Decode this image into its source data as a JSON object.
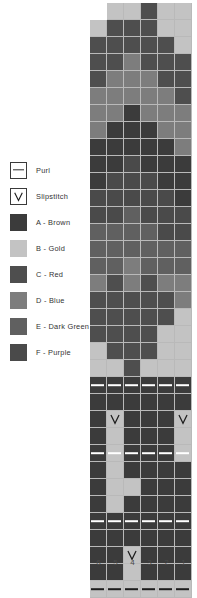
{
  "legend": {
    "title": "Chart Key",
    "items": [
      {
        "icon": "purl-dash-icon",
        "symbol": "purl",
        "label": "Purl",
        "color": "#ffffff"
      },
      {
        "icon": "slipstitch-v-icon",
        "symbol": "slip",
        "label": "Slipstitch",
        "color": "#ffffff"
      },
      {
        "icon": "color-swatch-icon",
        "symbol": "fill",
        "label": "A - Brown",
        "color": "#3b3b3b"
      },
      {
        "icon": "color-swatch-icon",
        "symbol": "fill",
        "label": "B - Gold",
        "color": "#c3c3c3"
      },
      {
        "icon": "color-swatch-icon",
        "symbol": "fill",
        "label": "C - Red",
        "color": "#4e4e4e"
      },
      {
        "icon": "color-swatch-icon",
        "symbol": "fill",
        "label": "D - Blue",
        "color": "#7d7d7d"
      },
      {
        "icon": "color-swatch-icon",
        "symbol": "fill",
        "label": "E - Dark Green",
        "color": "#606060"
      },
      {
        "icon": "color-swatch-icon",
        "symbol": "fill",
        "label": "F - Purple",
        "color": "#4a4a4a"
      }
    ]
  },
  "chart_data": {
    "type": "heatmap",
    "columns": 6,
    "rows": 34,
    "cell_size_px": 17,
    "grid_line_color": "#b9b9b9",
    "column_labels": [
      "6",
      "5",
      "4",
      "3",
      "2",
      "1"
    ],
    "palette": {
      "A": "#3b3b3b",
      "B": "#c3c3c3",
      "C": "#4e4e4e",
      "D": "#7d7d7d",
      "E": "#606060",
      "F": "#4a4a4a",
      "blank": "#ffffff"
    },
    "symbol_colors": {
      "purl_light": "#ffffff",
      "purl_dark": "#1d1d1d",
      "slip_stroke": "#1d1d1d"
    },
    "legend_position": "left",
    "grid": [
      {
        "row": 34,
        "cells": [
          {
            "key": "blank"
          },
          {
            "key": "B"
          },
          {
            "key": "B"
          },
          {
            "key": "C"
          },
          {
            "key": "B"
          },
          {
            "key": "B"
          }
        ]
      },
      {
        "row": 33,
        "cells": [
          {
            "key": "B"
          },
          {
            "key": "C"
          },
          {
            "key": "C"
          },
          {
            "key": "C"
          },
          {
            "key": "B"
          },
          {
            "key": "B"
          }
        ]
      },
      {
        "row": 32,
        "cells": [
          {
            "key": "C"
          },
          {
            "key": "C"
          },
          {
            "key": "C"
          },
          {
            "key": "C"
          },
          {
            "key": "C"
          },
          {
            "key": "B"
          }
        ]
      },
      {
        "row": 31,
        "cells": [
          {
            "key": "C"
          },
          {
            "key": "C"
          },
          {
            "key": "D"
          },
          {
            "key": "C"
          },
          {
            "key": "C"
          },
          {
            "key": "C"
          }
        ]
      },
      {
        "row": 30,
        "cells": [
          {
            "key": "C"
          },
          {
            "key": "D"
          },
          {
            "key": "D"
          },
          {
            "key": "D"
          },
          {
            "key": "C"
          },
          {
            "key": "C"
          }
        ]
      },
      {
        "row": 29,
        "cells": [
          {
            "key": "D"
          },
          {
            "key": "D"
          },
          {
            "key": "D"
          },
          {
            "key": "D"
          },
          {
            "key": "D"
          },
          {
            "key": "C"
          }
        ]
      },
      {
        "row": 28,
        "cells": [
          {
            "key": "D"
          },
          {
            "key": "D"
          },
          {
            "key": "A"
          },
          {
            "key": "D"
          },
          {
            "key": "D"
          },
          {
            "key": "D"
          }
        ]
      },
      {
        "row": 27,
        "cells": [
          {
            "key": "D"
          },
          {
            "key": "A"
          },
          {
            "key": "A"
          },
          {
            "key": "A"
          },
          {
            "key": "D"
          },
          {
            "key": "D"
          }
        ]
      },
      {
        "row": 26,
        "cells": [
          {
            "key": "A"
          },
          {
            "key": "A"
          },
          {
            "key": "A"
          },
          {
            "key": "A"
          },
          {
            "key": "A"
          },
          {
            "key": "D"
          }
        ]
      },
      {
        "row": 25,
        "cells": [
          {
            "key": "A"
          },
          {
            "key": "A"
          },
          {
            "key": "F"
          },
          {
            "key": "A"
          },
          {
            "key": "A"
          },
          {
            "key": "A"
          }
        ]
      },
      {
        "row": 24,
        "cells": [
          {
            "key": "A"
          },
          {
            "key": "F"
          },
          {
            "key": "F"
          },
          {
            "key": "F"
          },
          {
            "key": "A"
          },
          {
            "key": "A"
          }
        ]
      },
      {
        "row": 23,
        "cells": [
          {
            "key": "F"
          },
          {
            "key": "F"
          },
          {
            "key": "F"
          },
          {
            "key": "F"
          },
          {
            "key": "F"
          },
          {
            "key": "A"
          }
        ]
      },
      {
        "row": 22,
        "cells": [
          {
            "key": "F"
          },
          {
            "key": "F"
          },
          {
            "key": "E"
          },
          {
            "key": "F"
          },
          {
            "key": "F"
          },
          {
            "key": "F"
          }
        ]
      },
      {
        "row": 21,
        "cells": [
          {
            "key": "E"
          },
          {
            "key": "E"
          },
          {
            "key": "E"
          },
          {
            "key": "E"
          },
          {
            "key": "F"
          },
          {
            "key": "F"
          }
        ]
      },
      {
        "row": 20,
        "cells": [
          {
            "key": "E"
          },
          {
            "key": "E"
          },
          {
            "key": "E"
          },
          {
            "key": "E"
          },
          {
            "key": "E"
          },
          {
            "key": "E"
          }
        ]
      },
      {
        "row": 19,
        "cells": [
          {
            "key": "E"
          },
          {
            "key": "E"
          },
          {
            "key": "D"
          },
          {
            "key": "E"
          },
          {
            "key": "E"
          },
          {
            "key": "E"
          }
        ]
      },
      {
        "row": 18,
        "cells": [
          {
            "key": "D"
          },
          {
            "key": "C"
          },
          {
            "key": "D"
          },
          {
            "key": "C"
          },
          {
            "key": "D"
          },
          {
            "key": "D"
          }
        ]
      },
      {
        "row": 17,
        "cells": [
          {
            "key": "C"
          },
          {
            "key": "C"
          },
          {
            "key": "C"
          },
          {
            "key": "C"
          },
          {
            "key": "C"
          },
          {
            "key": "D"
          }
        ]
      },
      {
        "row": 16,
        "cells": [
          {
            "key": "C"
          },
          {
            "key": "C"
          },
          {
            "key": "C"
          },
          {
            "key": "C"
          },
          {
            "key": "C"
          },
          {
            "key": "B"
          }
        ]
      },
      {
        "row": 15,
        "cells": [
          {
            "key": "C"
          },
          {
            "key": "C"
          },
          {
            "key": "C"
          },
          {
            "key": "C"
          },
          {
            "key": "B"
          },
          {
            "key": "B"
          }
        ]
      },
      {
        "row": 14,
        "cells": [
          {
            "key": "B"
          },
          {
            "key": "C"
          },
          {
            "key": "C"
          },
          {
            "key": "C"
          },
          {
            "key": "B"
          },
          {
            "key": "B"
          }
        ]
      },
      {
        "row": 13,
        "cells": [
          {
            "key": "B"
          },
          {
            "key": "B"
          },
          {
            "key": "C"
          },
          {
            "key": "B"
          },
          {
            "key": "B"
          },
          {
            "key": "B"
          }
        ]
      },
      {
        "row": 12,
        "cells": [
          {
            "key": "A",
            "sym": "purl"
          },
          {
            "key": "A",
            "sym": "purl"
          },
          {
            "key": "A",
            "sym": "purl"
          },
          {
            "key": "A",
            "sym": "purl"
          },
          {
            "key": "A",
            "sym": "purl"
          },
          {
            "key": "A",
            "sym": "purl"
          }
        ]
      },
      {
        "row": 11,
        "cells": [
          {
            "key": "A"
          },
          {
            "key": "A"
          },
          {
            "key": "A"
          },
          {
            "key": "A"
          },
          {
            "key": "A"
          },
          {
            "key": "A"
          }
        ]
      },
      {
        "row": 10,
        "cells": [
          {
            "key": "A"
          },
          {
            "key": "B",
            "sym": "slip"
          },
          {
            "key": "A"
          },
          {
            "key": "A"
          },
          {
            "key": "A"
          },
          {
            "key": "B",
            "sym": "slip"
          }
        ]
      },
      {
        "row": 9,
        "cells": [
          {
            "key": "A"
          },
          {
            "key": "B"
          },
          {
            "key": "A"
          },
          {
            "key": "A"
          },
          {
            "key": "A"
          },
          {
            "key": "B"
          }
        ]
      },
      {
        "row": 8,
        "cells": [
          {
            "key": "A",
            "sym": "purl"
          },
          {
            "key": "B",
            "sym": "purl"
          },
          {
            "key": "A",
            "sym": "purl"
          },
          {
            "key": "A",
            "sym": "purl"
          },
          {
            "key": "A",
            "sym": "purl"
          },
          {
            "key": "B",
            "sym": "purl"
          }
        ]
      },
      {
        "row": 7,
        "cells": [
          {
            "key": "A"
          },
          {
            "key": "B"
          },
          {
            "key": "A"
          },
          {
            "key": "A"
          },
          {
            "key": "A"
          },
          {
            "key": "A"
          }
        ]
      },
      {
        "row": 6,
        "cells": [
          {
            "key": "A"
          },
          {
            "key": "B"
          },
          {
            "key": "B"
          },
          {
            "key": "A"
          },
          {
            "key": "A"
          },
          {
            "key": "A"
          }
        ]
      },
      {
        "row": 5,
        "cells": [
          {
            "key": "A"
          },
          {
            "key": "B"
          },
          {
            "key": "A"
          },
          {
            "key": "A"
          },
          {
            "key": "A"
          },
          {
            "key": "A"
          }
        ]
      },
      {
        "row": 4,
        "cells": [
          {
            "key": "A",
            "sym": "purl"
          },
          {
            "key": "A",
            "sym": "purl"
          },
          {
            "key": "A",
            "sym": "purl"
          },
          {
            "key": "A",
            "sym": "purl"
          },
          {
            "key": "A",
            "sym": "purl"
          },
          {
            "key": "A",
            "sym": "purl"
          }
        ]
      },
      {
        "row": 3,
        "cells": [
          {
            "key": "A"
          },
          {
            "key": "A"
          },
          {
            "key": "A"
          },
          {
            "key": "A"
          },
          {
            "key": "A"
          },
          {
            "key": "A"
          }
        ]
      },
      {
        "row": 2,
        "cells": [
          {
            "key": "A"
          },
          {
            "key": "A"
          },
          {
            "key": "B",
            "sym": "slip"
          },
          {
            "key": "A"
          },
          {
            "key": "A"
          },
          {
            "key": "A"
          }
        ]
      },
      {
        "row": 1,
        "cells": [
          {
            "key": "A"
          },
          {
            "key": "A"
          },
          {
            "key": "B"
          },
          {
            "key": "A"
          },
          {
            "key": "A"
          },
          {
            "key": "A"
          }
        ]
      },
      {
        "row": 0,
        "cells": [
          {
            "key": "B",
            "sym": "purl_dark"
          },
          {
            "key": "B",
            "sym": "purl_dark"
          },
          {
            "key": "B",
            "sym": "purl_dark"
          },
          {
            "key": "B",
            "sym": "purl_dark"
          },
          {
            "key": "B",
            "sym": "purl_dark"
          },
          {
            "key": "B",
            "sym": "purl_dark"
          }
        ]
      }
    ]
  }
}
